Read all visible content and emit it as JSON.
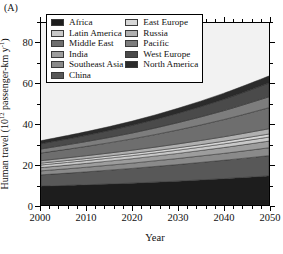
{
  "panel": {
    "label": "(A)"
  },
  "axes": {
    "xlabel": "Year",
    "ylabel_main": "Human travel (10",
    "ylabel_sup": "12",
    "ylabel_tail": " passenger-km y",
    "ylabel_sup2": "-1",
    "ylabel_close": ")",
    "x_ticks": [
      "2000",
      "2010",
      "2020",
      "2030",
      "2040",
      "2050"
    ],
    "y_ticks": [
      "0",
      "20",
      "40",
      "60",
      "80"
    ]
  },
  "legend": {
    "col1": [
      {
        "label": "Africa",
        "color": "#1d1d1d"
      },
      {
        "label": "Latin America",
        "color": "#c8c8c8"
      },
      {
        "label": "Middle East",
        "color": "#6e6e6e"
      },
      {
        "label": "India",
        "color": "#9d9d9d"
      },
      {
        "label": "Southeast Asia",
        "color": "#8a8a8a"
      },
      {
        "label": "China",
        "color": "#585858"
      }
    ],
    "col2": [
      {
        "label": "East Europe",
        "color": "#d6d6d6"
      },
      {
        "label": "Russia",
        "color": "#b0b0b0"
      },
      {
        "label": "Pacific",
        "color": "#7d7d7d"
      },
      {
        "label": "West Europe",
        "color": "#4a4a4a"
      },
      {
        "label": "North America",
        "color": "#2b2b2b"
      }
    ]
  },
  "chart_data": {
    "type": "area",
    "stacked": true,
    "title": "",
    "xlabel": "Year",
    "ylabel": "Human travel (10^12 passenger-km y^-1)",
    "xlim": [
      2000,
      2050
    ],
    "ylim": [
      0,
      90
    ],
    "grid": false,
    "legend_position": "top-center-inside",
    "x": [
      2000,
      2010,
      2020,
      2030,
      2040,
      2050
    ],
    "series": [
      {
        "name": "Africa",
        "color": "#1d1d1d",
        "values": [
          9.3,
          10.0,
          10.8,
          11.8,
          13.0,
          14.4
        ]
      },
      {
        "name": "China",
        "color": "#585858",
        "values": [
          5.6,
          6.4,
          7.3,
          8.2,
          9.1,
          10.0
        ]
      },
      {
        "name": "Southeast Asia",
        "color": "#8a8a8a",
        "values": [
          2.0,
          2.3,
          2.6,
          3.0,
          3.4,
          3.9
        ]
      },
      {
        "name": "India",
        "color": "#9d9d9d",
        "values": [
          1.6,
          1.9,
          2.2,
          2.5,
          2.9,
          3.3
        ]
      },
      {
        "name": "Latin America",
        "color": "#c8c8c8",
        "values": [
          1.3,
          1.4,
          1.5,
          1.6,
          1.8,
          2.0
        ]
      },
      {
        "name": "East Europe",
        "color": "#d6d6d6",
        "values": [
          0.9,
          1.0,
          1.1,
          1.2,
          1.3,
          1.5
        ]
      },
      {
        "name": "Russia",
        "color": "#b0b0b0",
        "values": [
          1.2,
          1.4,
          1.6,
          1.9,
          2.2,
          2.6
        ]
      },
      {
        "name": "Middle East",
        "color": "#6e6e6e",
        "values": [
          3.8,
          4.6,
          5.6,
          6.9,
          8.5,
          10.4
        ]
      },
      {
        "name": "Pacific",
        "color": "#7d7d7d",
        "values": [
          2.0,
          2.4,
          2.9,
          3.6,
          4.4,
          5.4
        ]
      },
      {
        "name": "West Europe",
        "color": "#4a4a4a",
        "values": [
          2.6,
          3.1,
          3.8,
          4.6,
          5.6,
          6.8
        ]
      },
      {
        "name": "North America",
        "color": "#2b2b2b",
        "values": [
          1.5,
          1.8,
          2.1,
          2.5,
          3.0,
          3.5
        ]
      }
    ],
    "totals": [
      31.8,
      36.3,
      41.5,
      47.8,
      55.2,
      63.8
    ]
  }
}
